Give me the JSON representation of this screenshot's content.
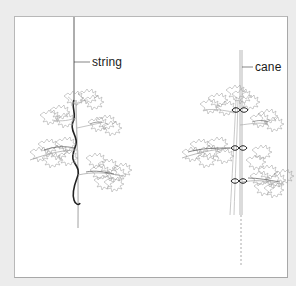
{
  "figure": {
    "labels": {
      "string": "string",
      "cane": "cane"
    },
    "colors": {
      "background": "#ececec",
      "panel": "#ffffff",
      "ink": "#1a1a1a",
      "foliage": "#8a8a8a"
    },
    "plants": [
      {
        "name": "string-supported-plant",
        "support": "string"
      },
      {
        "name": "cane-supported-plant",
        "support": "cane",
        "ties": 3
      }
    ]
  }
}
